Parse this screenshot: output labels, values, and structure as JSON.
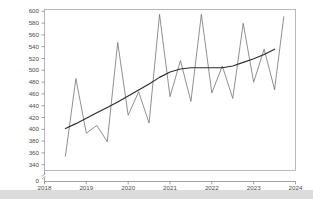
{
  "chart_data": {
    "type": "line",
    "title": "",
    "subtitle": "",
    "xlabel": "",
    "ylabel": "",
    "xlim": [
      2018,
      2024
    ],
    "ylim": [
      332,
      600
    ],
    "grid": false,
    "legend": "none",
    "y_axis_break": true,
    "y_axis_break_label": "0",
    "x_tick_labels": [
      "2018",
      "2019",
      "2020",
      "2021",
      "2022",
      "2023",
      "2024"
    ],
    "x_tick_values": [
      2018,
      2019,
      2020,
      2021,
      2022,
      2023,
      2024
    ],
    "y_tick_labels": [
      "340",
      "360",
      "380",
      "400",
      "420",
      "440",
      "460",
      "480",
      "500",
      "520",
      "540",
      "560",
      "580",
      "600"
    ],
    "y_tick_values": [
      340,
      360,
      380,
      400,
      420,
      440,
      460,
      480,
      500,
      520,
      540,
      560,
      580,
      600
    ],
    "series": [
      {
        "name": "quarterly-series",
        "color": "#6b6b6b",
        "x": [
          2018.5,
          2018.75,
          2019.0,
          2019.25,
          2019.5,
          2019.75,
          2020.0,
          2020.25,
          2020.5,
          2020.75,
          2021.0,
          2021.25,
          2021.5,
          2021.75,
          2022.0,
          2022.25,
          2022.5,
          2022.75,
          2023.0,
          2023.25,
          2023.5
        ],
        "values": [
          356,
          485,
          394,
          407,
          380,
          545,
          424,
          463,
          411,
          592,
          455,
          515,
          447,
          592,
          461,
          506,
          452,
          577,
          479,
          534,
          467
        ]
      },
      {
        "name": "trend-line",
        "color": "#2b2b2b",
        "x": [
          2018.5,
          2018.75,
          2019.0,
          2019.25,
          2019.5,
          2019.75,
          2020.0,
          2020.25,
          2020.5,
          2020.75,
          2021.0,
          2021.25,
          2021.5,
          2021.75,
          2022.0,
          2022.25,
          2022.5,
          2022.75,
          2023.0,
          2023.25,
          2023.5
        ],
        "values": [
          402,
          410,
          419,
          428,
          437,
          446,
          456,
          466,
          476,
          487,
          496,
          501,
          503,
          503,
          503,
          503,
          506,
          512,
          518,
          525,
          534
        ]
      },
      {
        "name": "final-rise",
        "color": "#6b6b6b",
        "x": [
          2023.5,
          2023.72
        ],
        "values": [
          467,
          588
        ]
      }
    ]
  },
  "figure": {
    "background_color": "#ffffff",
    "frame_color": "#9a9a9a",
    "band_color": "#dcdcdc"
  }
}
